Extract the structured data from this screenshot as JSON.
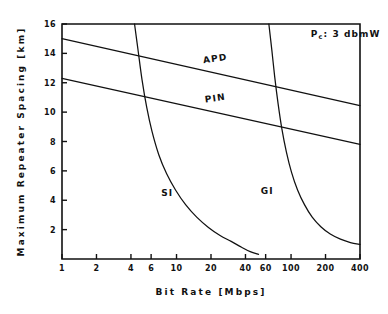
{
  "chart_data": {
    "type": "line",
    "title": "",
    "xlabel": "Bit Rate  [Mbps]",
    "ylabel": "Maximum  Repeater  Spacing  [km]",
    "xscale": "log",
    "yscale": "linear",
    "xlim": [
      1,
      400
    ],
    "ylim": [
      0,
      16
    ],
    "grid": false,
    "legend_position": "inline-curve-labels",
    "xticks": [
      1,
      2,
      4,
      6,
      10,
      20,
      40,
      60,
      100,
      200,
      400
    ],
    "xticklabels": [
      "1",
      "2",
      "4",
      "6",
      "10",
      "20",
      "40",
      "60",
      "100",
      "200",
      "400"
    ],
    "yticks": [
      2,
      4,
      6,
      8,
      10,
      12,
      14,
      16
    ],
    "yticklabels": [
      "2",
      "4",
      "6",
      "8",
      "10",
      "12",
      "14",
      "16"
    ],
    "annotations": [
      {
        "name": "power-annotation",
        "text_main": "P",
        "text_sub": "c",
        "text_rest": ": 3 dbmW",
        "full_text": "Pc: 3 dbmW",
        "x": 300,
        "y": 15.1
      }
    ],
    "series": [
      {
        "name": "APD",
        "label": "APD",
        "label_x": 22,
        "label_y": 13.45,
        "label_rotation": -8,
        "points": [
          {
            "x": 1,
            "y": 15.0
          },
          {
            "x": 400,
            "y": 10.45
          }
        ]
      },
      {
        "name": "PIN",
        "label": "PIN",
        "label_x": 22,
        "label_y": 10.75,
        "label_rotation": -8,
        "points": [
          {
            "x": 1,
            "y": 12.3
          },
          {
            "x": 400,
            "y": 7.8
          }
        ]
      },
      {
        "name": "SI",
        "label": "SI",
        "label_x": 8.3,
        "label_y": 4.3,
        "label_rotation": 0,
        "points": [
          {
            "x": 4.3,
            "y": 16.0
          },
          {
            "x": 4.6,
            "y": 14.3
          },
          {
            "x": 5.0,
            "y": 12.2
          },
          {
            "x": 5.5,
            "y": 10.3
          },
          {
            "x": 6.1,
            "y": 8.7
          },
          {
            "x": 7.0,
            "y": 7.1
          },
          {
            "x": 8.2,
            "y": 5.8
          },
          {
            "x": 9.8,
            "y": 4.7
          },
          {
            "x": 12.0,
            "y": 3.7
          },
          {
            "x": 15.0,
            "y": 2.85
          },
          {
            "x": 19.0,
            "y": 2.15
          },
          {
            "x": 24.0,
            "y": 1.6
          },
          {
            "x": 30.0,
            "y": 1.2
          },
          {
            "x": 37.0,
            "y": 0.8
          },
          {
            "x": 44.0,
            "y": 0.5
          },
          {
            "x": 52.0,
            "y": 0.32
          }
        ]
      },
      {
        "name": "GI",
        "label": "GI",
        "label_x": 62,
        "label_y": 4.45,
        "label_rotation": 0,
        "points": [
          {
            "x": 64.0,
            "y": 16.0
          },
          {
            "x": 68.0,
            "y": 14.2
          },
          {
            "x": 72.0,
            "y": 12.4
          },
          {
            "x": 77.0,
            "y": 10.6
          },
          {
            "x": 83.0,
            "y": 8.9
          },
          {
            "x": 91.0,
            "y": 7.3
          },
          {
            "x": 101.0,
            "y": 5.9
          },
          {
            "x": 114.0,
            "y": 4.7
          },
          {
            "x": 131.0,
            "y": 3.7
          },
          {
            "x": 153.0,
            "y": 2.85
          },
          {
            "x": 182.0,
            "y": 2.2
          },
          {
            "x": 220.0,
            "y": 1.7
          },
          {
            "x": 270.0,
            "y": 1.35
          },
          {
            "x": 330.0,
            "y": 1.12
          },
          {
            "x": 400.0,
            "y": 1.0
          }
        ]
      }
    ]
  }
}
